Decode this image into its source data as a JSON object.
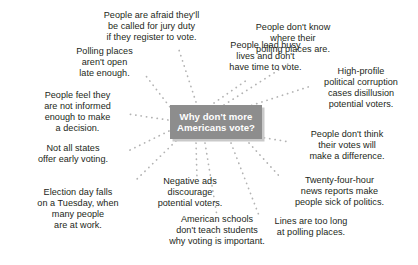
{
  "diagram": {
    "type": "mind-map",
    "title": "Why don't more Americans vote?",
    "center": {
      "label": "Why don't more\nAmericans vote?",
      "line1": "Why don't more",
      "line2": "Americans vote?",
      "background_color": "#8d8d8d",
      "text_color": "#ffffff",
      "shadow_color": "#c9c9c9"
    },
    "connector": {
      "style": "dotted",
      "color": "#b3b3b3"
    },
    "text_color": "#231f20",
    "branch_count": 12,
    "branches": [
      {
        "id": "jury-duty",
        "label": "People are afraid they'll\nbe called for jury duty\nif they register to vote.",
        "align": "center"
      },
      {
        "id": "busy-lives",
        "label": "People lead busy\nlives and don't\nhave time to vote.",
        "align": "center"
      },
      {
        "id": "dont-know-where",
        "label": "People don't know\nwhere their\npolling places are.",
        "align": "center"
      },
      {
        "id": "corruption",
        "label": "High-profile\npolitical corruption\ncases disillusion\npotential voters.",
        "align": "center"
      },
      {
        "id": "polling-hours",
        "label": "Polling places\naren't open\nlate enough.",
        "align": "center"
      },
      {
        "id": "not-informed",
        "label": "People feel they\nare not informed\nenough to make\na decision.",
        "align": "center"
      },
      {
        "id": "no-early-voting",
        "label": "Not all states\noffer early voting.",
        "align": "center"
      },
      {
        "id": "tuesday-workday",
        "label": "Election day falls\non a Tuesday, when\nmany people\nare at work.",
        "align": "center"
      },
      {
        "id": "negative-ads",
        "label": "Negative ads\ndiscourage\npotential voters.",
        "align": "center"
      },
      {
        "id": "schools-civics",
        "label": "American schools\ndon't teach students\nwhy voting is important.",
        "align": "center"
      },
      {
        "id": "votes-dont-matter",
        "label": "People don't think\ntheir votes will\nmake a difference.",
        "align": "center"
      },
      {
        "id": "news-cycle",
        "label": "Twenty-four-hour\nnews reports make\npeople sick of politics.",
        "align": "center"
      },
      {
        "id": "long-lines",
        "label": "Lines are too long\nat polling places.",
        "align": "center"
      }
    ]
  }
}
